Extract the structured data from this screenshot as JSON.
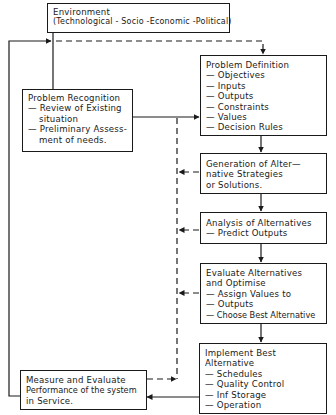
{
  "diagram": {
    "type": "flowchart",
    "colors": {
      "stroke": "#1a1a1a",
      "background": "#ffffff"
    },
    "nodes": {
      "environment": {
        "lines": [
          "Environment",
          "(Technological - Socio -Economic -Political)"
        ]
      },
      "problem_recognition": {
        "lines": [
          "Problem Recognition",
          "— Review of Existing",
          "situation",
          "— Preliminary Assess-",
          "ment of needs."
        ]
      },
      "problem_definition": {
        "lines": [
          "Problem Definition",
          "— Objectives",
          "— Inputs",
          "— Outputs",
          "— Constraints",
          "— Values",
          "— Decision Rules"
        ]
      },
      "generation": {
        "lines": [
          "Generation of Alter—",
          "native Strategies",
          "or Solutions."
        ]
      },
      "analysis": {
        "lines": [
          "Analysis of Alternatives",
          "— Predict Outputs"
        ]
      },
      "evaluate": {
        "lines": [
          "Evaluate Alternatives",
          "and Optimise",
          "— Assign Values to",
          "— Outputs",
          "— Choose Best Alternative"
        ]
      },
      "implement": {
        "lines": [
          "Implement Best",
          "Alternative",
          "— Schedules",
          "— Quality Control",
          "— Inf Storage",
          "— Operation"
        ]
      },
      "measure": {
        "lines": [
          "Measure and Evaluate",
          "Performance of the system",
          "in Service."
        ]
      }
    },
    "edges": [
      {
        "from": "environment",
        "to": "problem_recognition",
        "style": "solid"
      },
      {
        "from": "problem_recognition",
        "to": "problem_definition",
        "style": "solid"
      },
      {
        "from": "environment_line",
        "to": "problem_definition",
        "style": "dashed"
      },
      {
        "from": "problem_definition",
        "to": "generation",
        "style": "solid"
      },
      {
        "from": "generation",
        "to": "analysis",
        "style": "solid"
      },
      {
        "from": "analysis",
        "to": "evaluate",
        "style": "solid"
      },
      {
        "from": "evaluate",
        "to": "implement",
        "style": "solid"
      },
      {
        "from": "implement",
        "to": "measure",
        "style": "solid"
      },
      {
        "from": "measure",
        "to": "environment_line",
        "style": "solid",
        "note": "feedback loop"
      },
      {
        "from": "generation",
        "to": "feedback_bus",
        "style": "dashed"
      },
      {
        "from": "analysis",
        "to": "feedback_bus",
        "style": "dashed"
      },
      {
        "from": "evaluate",
        "to": "feedback_bus",
        "style": "dashed"
      },
      {
        "from": "measure",
        "to": "feedback_bus",
        "style": "dashed"
      }
    ]
  }
}
